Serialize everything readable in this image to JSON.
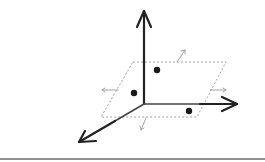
{
  "diagram": {
    "title": "",
    "colors": {
      "axis": "#222222",
      "plane": "#8a8a8a",
      "small_arrows": "#9a9a9a",
      "points": "#1a1a1a",
      "baseline": "#6a6a6a"
    },
    "origin": [
      144,
      104
    ],
    "axes": [
      {
        "name": "vertical",
        "from": [
          144,
          104
        ],
        "to": [
          144,
          10
        ]
      },
      {
        "name": "horizontal",
        "from": [
          144,
          104
        ],
        "to": [
          238,
          104
        ]
      },
      {
        "name": "depth",
        "from": [
          144,
          104
        ],
        "to": [
          78,
          143
        ]
      }
    ],
    "plane": {
      "corners": [
        [
          133,
          62
        ],
        [
          226,
          62
        ],
        [
          197,
          117
        ],
        [
          101,
          117
        ]
      ],
      "style": "dashed"
    },
    "points": [
      {
        "x": 157,
        "y": 70
      },
      {
        "x": 134,
        "y": 93
      },
      {
        "x": 189,
        "y": 111
      }
    ],
    "direction_arrows": [
      {
        "from": [
          177,
          62
        ],
        "to": [
          185,
          50
        ]
      },
      {
        "from": [
          118,
          90
        ],
        "to": [
          102,
          90
        ]
      },
      {
        "from": [
          210,
          90
        ],
        "to": [
          226,
          90
        ]
      },
      {
        "from": [
          146,
          118
        ],
        "to": [
          141,
          130
        ]
      }
    ]
  }
}
